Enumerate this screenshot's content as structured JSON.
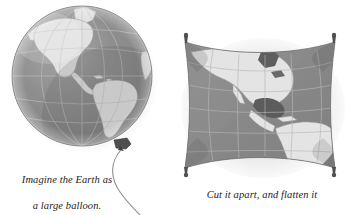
{
  "figure": {
    "background_color": "#ffffff",
    "ink_color": "#1c1c1c"
  },
  "globe_panel": {
    "name": "globe-balloon-illustration",
    "subject": "Earth globe drawn as an inflated balloon showing the Americas",
    "caption": {
      "line1": "Imagine the Earth as",
      "line2": "a large balloon."
    },
    "parts": {
      "sphere": "globe-sphere",
      "ocean": "globe-ocean",
      "land": "globe-landmasses",
      "graticule": "globe-graticule",
      "knot": "balloon-knot",
      "string": "balloon-string"
    },
    "colors": {
      "ocean": "#8c8c8c",
      "ocean_shadow": "#6f6f6f",
      "ocean_highlight": "#a8a8a8",
      "land": "#e2e2e2",
      "land_edge": "#9a9a9a",
      "graticule": "#b9b9b9",
      "outline": "#7a7a7a",
      "knot": "#4a4a4a",
      "string": "#8f8f8f"
    },
    "geometry": {
      "center_x": 82,
      "center_y": 76,
      "radius": 70,
      "knot_x": 122,
      "knot_y": 144
    }
  },
  "map_panel": {
    "name": "flattened-map-illustration",
    "subject": "Balloon cut apart and flattened into a rectangular map of the Americas",
    "caption": {
      "line1": "Cut it apart, and flatten it",
      "line2": "to make a map."
    },
    "parts": {
      "sheet": "map-sheet",
      "ocean": "map-ocean",
      "land": "map-landmasses",
      "graticule": "map-graticule",
      "pins": "map-corner-pins"
    },
    "colors": {
      "ocean": "#8a8a8a",
      "ocean_dark": "#787878",
      "land": "#e4e4e4",
      "land_edge": "#9d9d9d",
      "graticule": "#b0b0b0",
      "edge": "#6a6a6a",
      "pin": "#555555",
      "shadow": "#cfcfcf"
    },
    "geometry": {
      "left": 10,
      "top": 40,
      "right": 164,
      "bottom": 170
    },
    "corner_pins": [
      {
        "label": "pin-top-left",
        "x": 12,
        "y": 42
      },
      {
        "label": "pin-top-right",
        "x": 162,
        "y": 42
      },
      {
        "label": "pin-bottom-left",
        "x": 12,
        "y": 168
      },
      {
        "label": "pin-bottom-right",
        "x": 162,
        "y": 168
      }
    ]
  }
}
